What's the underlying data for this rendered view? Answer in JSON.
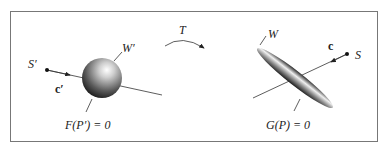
{
  "diagram": {
    "transform_label": "T",
    "left": {
      "source_label": "S′",
      "vector_label": "c′",
      "surface_label": "W′",
      "equation": "F(P′) = 0"
    },
    "right": {
      "source_label": "S",
      "vector_label": "c",
      "surface_label": "W",
      "equation": "G(P) = 0"
    }
  }
}
